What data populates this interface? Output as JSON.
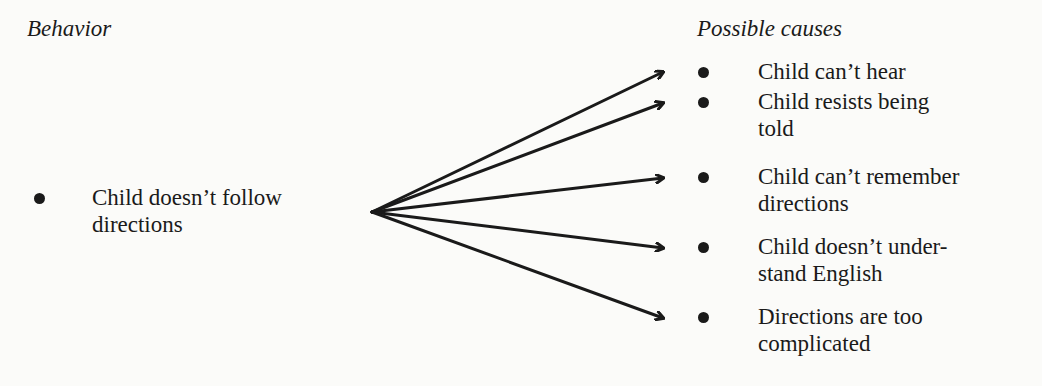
{
  "left": {
    "heading": "Behavior",
    "item": {
      "line1": "Child doesn’t follow",
      "line2": "directions"
    }
  },
  "right": {
    "heading": "Possible causes",
    "items": [
      {
        "line1": "Child can’t hear",
        "line2": ""
      },
      {
        "line1": "Child resists being",
        "line2": "told"
      },
      {
        "line1": "Child can’t remember",
        "line2": "directions"
      },
      {
        "line1": "Child doesn’t under-",
        "line2": "stand English"
      },
      {
        "line1": "Directions are too",
        "line2": "complicated"
      }
    ]
  },
  "arrows": {
    "count": 5,
    "origin": [
      372,
      212
    ],
    "targets": [
      [
        665,
        72
      ],
      [
        665,
        103
      ],
      [
        665,
        178
      ],
      [
        665,
        248
      ],
      [
        665,
        318
      ]
    ],
    "color": "#1a1a1a"
  }
}
